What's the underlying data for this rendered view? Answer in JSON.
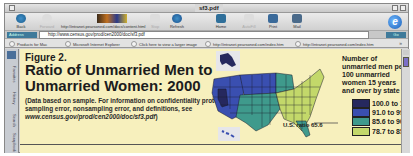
{
  "window": {
    "title": "sf3.pdf"
  },
  "toolbar": {
    "buttons": [
      {
        "label": "Back",
        "icon": "back-arrow-icon",
        "enabled": true
      },
      {
        "label": "Forward",
        "icon": "forward-arrow-icon",
        "enabled": false
      },
      {
        "label": "Stop",
        "icon": "stop-icon",
        "enabled": false
      },
      {
        "label": "Refresh",
        "icon": "refresh-icon",
        "enabled": true
      },
      {
        "label": "Home",
        "icon": "home-icon",
        "enabled": true
      },
      {
        "label": "AutoFill",
        "icon": "autofill-icon",
        "enabled": false
      },
      {
        "label": "Print",
        "icon": "print-icon",
        "enabled": true
      },
      {
        "label": "Mail",
        "icon": "mail-icon",
        "enabled": true
      }
    ],
    "status_url": "http://intranet.pearsoned.com/docs/content.html"
  },
  "address_bar": {
    "label": "Address",
    "url": "http://www.census.gov/prod/cen2000/doc/sf3.pdf",
    "go_label": "Go"
  },
  "favorites": [
    "Products for Mac",
    "Microsoft Internet Explorer",
    "Click here to view a larger image",
    "http://intranet.pearsoned.com/index.htm",
    "http://intranet.pearsoned.com/index.htm"
  ],
  "sidebar_tabs": [
    "Favorites",
    "History",
    "Search",
    "Scrapbook"
  ],
  "document": {
    "figure_number": "Figure 2.",
    "figure_title": "Ratio of Unmarried Men to Unmarried Women: 2000",
    "note_prefix": "(Data based on sample. For information on confidentiality protection, sampling error, nonsampling error, and definitions, see ",
    "note_link": "www.census.gov/prod/cen2000/doc/sf3.pdf",
    "note_suffix": ")",
    "us_ratio_label": "U.S. ratio 65.6",
    "legend_title": "Number of unmarried men per 100 unmarried women 15 years and over by state",
    "legend": [
      {
        "label": "100.0 to 114.2",
        "color": "#26285e"
      },
      {
        "label": "91.0 to 99.9",
        "color": "#3a4fb0"
      },
      {
        "label": "85.6 to 90.9",
        "color": "#3f9a8c"
      },
      {
        "label": "78.7 to 85.5",
        "color": "#c3d86a"
      }
    ]
  },
  "colors": {
    "page_bg": "#f7f0bd",
    "ocean": "#e8e8e0"
  }
}
